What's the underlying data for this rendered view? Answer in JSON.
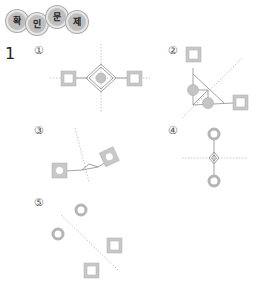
{
  "header": {
    "badges": [
      "확",
      "인",
      "문",
      "제"
    ]
  },
  "question": {
    "number": "1"
  },
  "options": [
    {
      "label": "①",
      "description": "Two squares left and right, diamond with shaded circle center, dotted crossing axes"
    },
    {
      "label": "②",
      "description": "Square top, two shaded circles, square right, triangle bonds, diagonal dotted line"
    },
    {
      "label": "③",
      "description": "Shaded square left with circle, tilted shaded square right, small triangle, tilted dotted line"
    },
    {
      "label": "④",
      "description": "Circle top and bottom, small diamond center, horizontal dotted line"
    },
    {
      "label": "⑤",
      "description": "Two circles and two squares separated by diagonal dotted line"
    }
  ],
  "colors": {
    "shape_stroke": "#999999",
    "shape_fill": "#c8c8c8",
    "dotted_line": "#bbbbbb",
    "text": "#333333"
  }
}
